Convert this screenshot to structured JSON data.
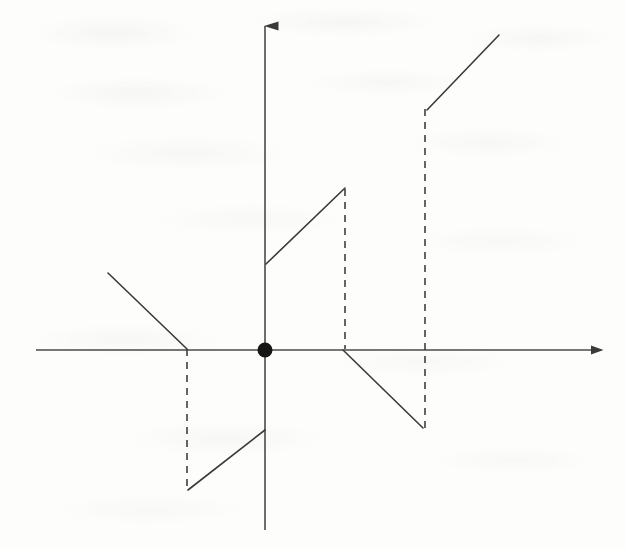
{
  "figure": {
    "kind": "mathematical-graph",
    "title": "",
    "caption": "",
    "background_color": "#fdfdfc",
    "ink_color": "#3a3a38",
    "axis_color": "#4a4a48",
    "dash_color": "#3f3f3d",
    "origin_dot_color": "#161614",
    "stroke_width": 1.6,
    "dash_pattern": "7 6"
  },
  "axes": {
    "origin": {
      "x": 265,
      "y": 350
    },
    "x_axis": {
      "name": "horizontal-axis",
      "from": {
        "x": 36,
        "y": 350
      },
      "to": {
        "x": 600,
        "y": 350
      },
      "arrow_at": "end",
      "label": "",
      "ticks": [],
      "tick_labels": []
    },
    "y_axis": {
      "name": "vertical-axis",
      "from": {
        "x": 265,
        "y": 530
      },
      "to": {
        "x": 265,
        "y": 16
      },
      "arrow_at": "start-top",
      "label": "",
      "ticks": [],
      "tick_labels": []
    },
    "origin_marker": {
      "name": "origin-point",
      "cx": 265,
      "cy": 350,
      "r": 7.5,
      "filled": true
    }
  },
  "chart_data": {
    "type": "line",
    "title": "",
    "subtitle": "",
    "xlabel": "",
    "ylabel": "",
    "grid": false,
    "legend": "none",
    "axis_arrows": {
      "x": "right",
      "y": "up"
    },
    "pixel_frame": {
      "width": 626,
      "height": 548,
      "origin_px": [
        265,
        350
      ],
      "y_down": true
    },
    "solid_branches": [
      {
        "name": "branch-far-left-descending",
        "quadrant": "II",
        "direction": "descending",
        "slope_sign": "negative",
        "points_px": [
          [
            108,
            273
          ],
          [
            187,
            349
          ]
        ],
        "endpoint_style": [
          "open",
          "open"
        ]
      },
      {
        "name": "branch-lower-left-ascending",
        "quadrant": "III",
        "direction": "ascending",
        "slope_sign": "positive",
        "points_px": [
          [
            188,
            490
          ],
          [
            265,
            430
          ]
        ],
        "endpoint_style": [
          "open",
          "open"
        ]
      },
      {
        "name": "branch-upper-middle-ascending",
        "quadrant": "I",
        "direction": "ascending",
        "slope_sign": "positive",
        "points_px": [
          [
            266,
            264
          ],
          [
            345,
            188
          ]
        ],
        "endpoint_style": [
          "open",
          "open"
        ]
      },
      {
        "name": "branch-right-descending",
        "quadrant": "IV",
        "direction": "descending",
        "slope_sign": "negative",
        "points_px": [
          [
            343,
            350
          ],
          [
            423,
            428
          ]
        ],
        "endpoint_style": [
          "open",
          "open"
        ]
      },
      {
        "name": "branch-far-right-ascending",
        "quadrant": "I",
        "direction": "ascending",
        "slope_sign": "positive",
        "points_px": [
          [
            427,
            110
          ],
          [
            499,
            35
          ]
        ],
        "endpoint_style": [
          "open",
          "open"
        ]
      }
    ],
    "dashed_jumps": [
      {
        "name": "jump-left",
        "x_px": 187,
        "from_px": [
          187,
          349
        ],
        "to_px": [
          187,
          489
        ],
        "orientation": "vertical",
        "meaning": "jump discontinuity connector"
      },
      {
        "name": "jump-middle",
        "x_px": 345,
        "from_px": [
          345,
          189
        ],
        "to_px": [
          345,
          349
        ],
        "orientation": "vertical",
        "meaning": "jump discontinuity connector"
      },
      {
        "name": "jump-right",
        "x_px": 425,
        "from_px": [
          425,
          109
        ],
        "to_px": [
          425,
          430
        ],
        "orientation": "vertical",
        "meaning": "jump discontinuity connector"
      }
    ],
    "annotations": [],
    "data_labels": []
  }
}
